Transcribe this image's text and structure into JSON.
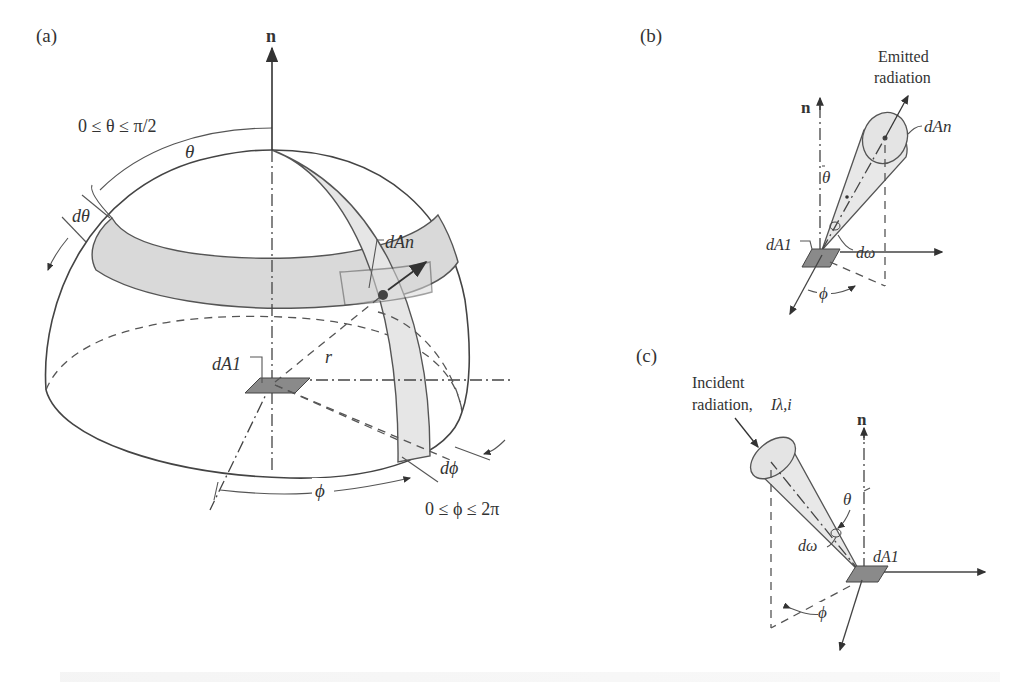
{
  "figure": {
    "panels": [
      {
        "id": "a",
        "label": "(a)",
        "normal_label": "n",
        "theta_range": "0 ≤ θ ≤ π/2",
        "theta": "θ",
        "dtheta": "dθ",
        "dAn": "dAn",
        "dA1": "dA1",
        "r": "r",
        "phi": "ϕ",
        "dphi": "dϕ",
        "phi_range": "0 ≤ ϕ ≤ 2π"
      },
      {
        "id": "b",
        "label": "(b)",
        "title_line1": "Emitted",
        "title_line2": "radiation",
        "normal_label": "n",
        "dAn": "dAn",
        "theta": "θ",
        "dA1": "dA1",
        "domega": "dω",
        "phi": "ϕ"
      },
      {
        "id": "c",
        "label": "(c)",
        "title_line1": "Incident",
        "title_line2": "radiation,",
        "intensity": "Iλ,i",
        "normal_label": "n",
        "theta": "θ",
        "domega": "dω",
        "dA1": "dA1",
        "phi": "ϕ"
      }
    ]
  }
}
